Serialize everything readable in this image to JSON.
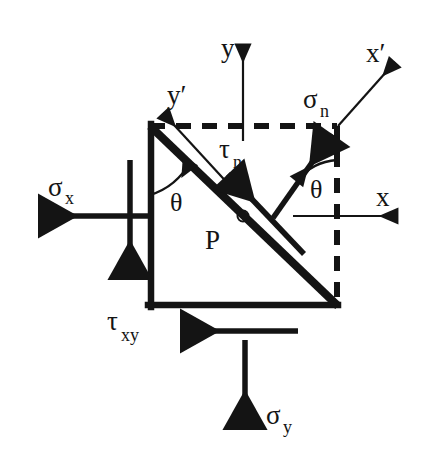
{
  "figure": {
    "background_color": "#ffffff",
    "ink_color": "#141414"
  },
  "labels": {
    "axis_y": "y",
    "axis_x": "x",
    "axis_x_prime": "x′",
    "axis_y_prime": "y′",
    "sigma_x": "σ",
    "sigma_x_sub": "x",
    "sigma_y": "σ",
    "sigma_y_sub": "y",
    "sigma_n": "σ",
    "sigma_n_sub": "n",
    "tau_xy": "τ",
    "tau_xy_sub": "xy",
    "tau_n": "τ",
    "tau_n_sub": "n",
    "theta_left": "θ",
    "theta_right": "θ",
    "plane_point": "P"
  },
  "geometry": {
    "triangle": {
      "top_left": [
        150,
        126
      ],
      "bottom_left": [
        150,
        307
      ],
      "bottom_right": [
        337,
        307
      ]
    },
    "dashed_top": [
      [
        150,
        126
      ],
      [
        337,
        126
      ]
    ],
    "dashed_right": [
      [
        337,
        126
      ],
      [
        337,
        307
      ]
    ],
    "diagonal_plane": [
      [
        150,
        126
      ],
      [
        337,
        307
      ]
    ],
    "y_axis": [
      [
        243,
        140
      ],
      [
        243,
        38
      ]
    ],
    "x_axis": [
      [
        293,
        216
      ],
      [
        404,
        216
      ]
    ],
    "sigma_n_vector": [
      [
        275,
        215
      ],
      [
        338,
        126
      ]
    ],
    "x_prime_axis": [
      [
        338,
        126
      ],
      [
        400,
        57
      ]
    ],
    "y_prime_axis": [
      [
        228,
        183
      ],
      [
        158,
        108
      ]
    ],
    "tau_n_vector": [
      [
        302,
        252
      ],
      [
        222,
        168
      ]
    ],
    "sigma_x_arrow": [
      [
        148,
        216
      ],
      [
        30,
        216
      ]
    ],
    "sigma_y_arrow": [
      [
        245,
        340
      ],
      [
        245,
        438
      ]
    ],
    "tau_xy_arrow_left": [
      [
        148,
        160
      ],
      [
        148,
        288
      ]
    ],
    "tau_xy_arrow_bottom": [
      [
        298,
        331
      ],
      [
        172,
        331
      ]
    ],
    "point_P": [
      243,
      216
    ],
    "theta_left_arc_center": [
      150,
      126
    ],
    "theta_right_arc_center": [
      337,
      216
    ]
  },
  "annotations": {
    "theta_value_note": "angle between x and x′ axes",
    "plane_label_note": "P marks the inclined plane"
  }
}
